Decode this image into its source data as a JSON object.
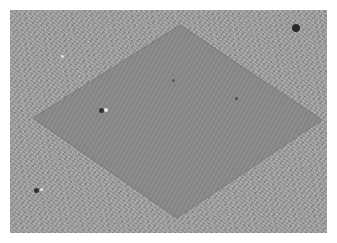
{
  "image": {
    "description": "Grayscale micrograph: rhombus-shaped smooth region on a wrinkled/textured background",
    "background_color": "#9a9a9a",
    "rhombus_color": "#8a8a8a",
    "rhombus_vertices": {
      "top": [
        180,
        25
      ],
      "right": [
        322,
        120
      ],
      "bottom": [
        177,
        218
      ],
      "left": [
        33,
        118
      ]
    },
    "particles": [
      {
        "x": 296,
        "y": 28,
        "r": 4,
        "color": "#2a2a2a"
      },
      {
        "x": 62,
        "y": 56,
        "r": 1.5,
        "color": "#e0e0e0"
      },
      {
        "x": 101,
        "y": 110,
        "r": 2.5,
        "color": "#333333"
      },
      {
        "x": 106,
        "y": 110,
        "r": 2,
        "color": "#e8e8e8"
      },
      {
        "x": 173,
        "y": 80,
        "r": 1.5,
        "color": "#555555"
      },
      {
        "x": 236,
        "y": 98,
        "r": 1.5,
        "color": "#4a4a4a"
      },
      {
        "x": 36,
        "y": 190,
        "r": 2.5,
        "color": "#2e2e2e"
      },
      {
        "x": 41,
        "y": 189,
        "r": 1.5,
        "color": "#e8e8e8"
      }
    ]
  }
}
